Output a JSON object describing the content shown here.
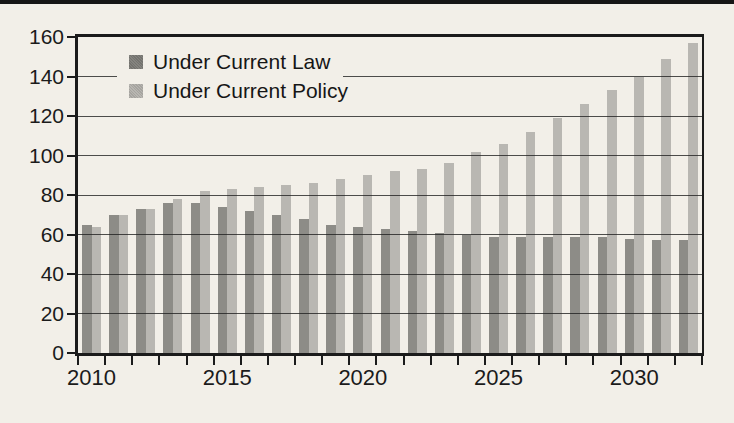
{
  "figure": {
    "background_color": "#f2efe8",
    "top_rule_color": "#161616",
    "axis_line_color": "#1b1b1b",
    "grid_line_color": "#1e1e1e",
    "text_color": "#1b1b1b"
  },
  "legend": {
    "items": [
      "Under Current Law",
      "Under Current Policy"
    ]
  },
  "chart_data": {
    "type": "bar",
    "title": "",
    "xlabel": "",
    "ylabel": "",
    "x": [
      2010,
      2011,
      2012,
      2013,
      2014,
      2015,
      2016,
      2017,
      2018,
      2019,
      2020,
      2021,
      2022,
      2023,
      2024,
      2025,
      2026,
      2027,
      2028,
      2029,
      2030,
      2031,
      2032
    ],
    "series": [
      {
        "name": "Under Current Law",
        "color": "#8d8c87",
        "values": [
          65,
          70,
          73,
          76,
          76,
          74,
          72,
          70,
          68,
          65,
          64,
          63,
          62,
          61,
          60,
          59,
          59,
          59,
          59,
          59,
          58,
          57,
          57
        ]
      },
      {
        "name": "Under Current Policy",
        "color": "#b9b7b2",
        "values": [
          64,
          70,
          73,
          78,
          82,
          83,
          84,
          85,
          86,
          88,
          90,
          92,
          93,
          96,
          102,
          106,
          112,
          119,
          126,
          133,
          140,
          149,
          157
        ]
      }
    ],
    "ylim": [
      0,
      160
    ],
    "y_ticks": [
      0,
      20,
      40,
      60,
      80,
      100,
      120,
      140,
      160
    ],
    "x_tick_labels": [
      "2010",
      "2015",
      "2020",
      "2025",
      "2030"
    ],
    "x_label_years": [
      2010,
      2015,
      2020,
      2025,
      2030
    ],
    "grid": "horizontal",
    "legend_position": "top-left-inside"
  }
}
